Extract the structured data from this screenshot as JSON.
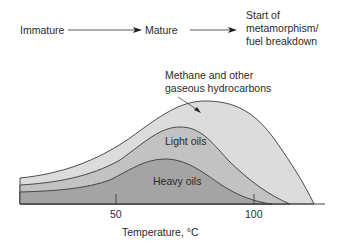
{
  "stages": {
    "immature": "Immature",
    "mature": "Mature",
    "start_line1": "Start of",
    "start_line2": "metamorphism/",
    "start_line3": "fuel breakdown"
  },
  "annotations": {
    "methane_line1": "Methane and other",
    "methane_line2": "gaseous hydrocarbons",
    "light_oils": "Light oils",
    "heavy_oils": "Heavy oils"
  },
  "axis": {
    "xlabel": "Temperature,  °C",
    "ticks": [
      "50",
      "100"
    ]
  },
  "colors": {
    "methane": "#dcdcdc",
    "light_oils": "#c2c2c2",
    "heavy_oils": "#a4a4a4",
    "outline": "#3a3a3a"
  }
}
